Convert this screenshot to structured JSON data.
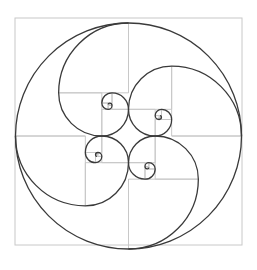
{
  "diagram": {
    "colors": {
      "background": "#ffffff",
      "grid": "#c8c8c8",
      "curve": "#3a3a3a"
    },
    "geometry": {
      "center": [
        128.5,
        136
      ],
      "outer_square": {
        "x": 15,
        "y": 18,
        "size": 227
      },
      "outer_circle_radius": 113,
      "spiral_count": 4,
      "ratio": 1.618
    }
  }
}
